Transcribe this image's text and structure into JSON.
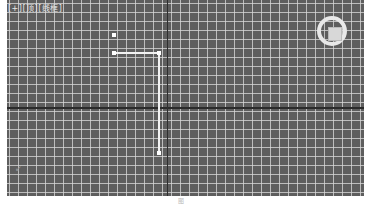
{
  "viewport": {
    "label": "[+][顶][线框]",
    "view": "Top",
    "shading": "Wireframe",
    "grid_spacing_px": 9,
    "colors": {
      "background": "#5e5e5e",
      "grid": "#dcdcdc",
      "axis": "#2a2a2a",
      "shape": "#f2f2f2"
    }
  },
  "shape": {
    "vertices": [
      {
        "x": 114,
        "y": 35
      },
      {
        "x": 114,
        "y": 53
      },
      {
        "x": 159,
        "y": 53
      },
      {
        "x": 159,
        "y": 153
      }
    ]
  },
  "viewcube": {
    "name": "viewcube"
  },
  "axis_gizmo": {
    "glyph": "↙"
  },
  "caption": {
    "text": "图"
  }
}
